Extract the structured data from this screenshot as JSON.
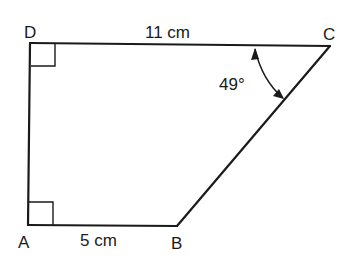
{
  "diagram": {
    "type": "trapezium",
    "vertices": {
      "A": {
        "label": "A",
        "x": 28,
        "y": 225
      },
      "B": {
        "label": "B",
        "x": 177,
        "y": 226
      },
      "C": {
        "label": "C",
        "x": 330,
        "y": 46
      },
      "D": {
        "label": "D",
        "x": 30,
        "y": 43
      }
    },
    "sides": {
      "DC": {
        "label": "11 cm"
      },
      "AB": {
        "label": "5 cm"
      }
    },
    "angles": {
      "C": {
        "label": "49°"
      }
    },
    "right_angles": [
      "D",
      "A"
    ],
    "colors": {
      "stroke": "#1a1a1a",
      "background": "#ffffff"
    }
  }
}
